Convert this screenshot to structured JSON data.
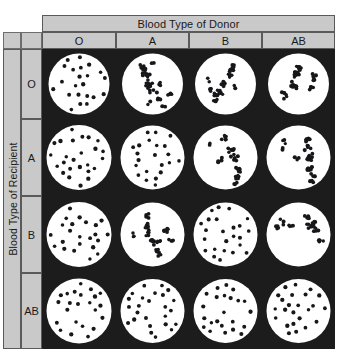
{
  "figure": {
    "column_axis_title": "Blood Type of Donor",
    "row_axis_title": "Blood Type of Recipient",
    "donor_types": [
      "O",
      "A",
      "B",
      "AB"
    ],
    "recipient_types": [
      "O",
      "A",
      "B",
      "AB"
    ],
    "colors": {
      "header_fill": "#c9c9c9",
      "header_border": "#5a5a5a",
      "well_background": "#1c1c1c",
      "plate_fill": "#ffffff",
      "cell_fill": "#17171a"
    }
  },
  "chart_data": {
    "type": "heatmap",
    "title": "Blood Type of Donor",
    "xlabel": "Blood Type of Donor",
    "ylabel": "Blood Type of Recipient",
    "categories": [
      "O",
      "A",
      "B",
      "AB"
    ],
    "rows": [
      "O",
      "A",
      "B",
      "AB"
    ],
    "legend": [
      "dispersed = no agglutination (compatible)",
      "clumped = agglutination (incompatible)"
    ],
    "grid": false,
    "values": [
      [
        0,
        1,
        1,
        1
      ],
      [
        0,
        0,
        1,
        1
      ],
      [
        0,
        1,
        0,
        1
      ],
      [
        0,
        0,
        0,
        0
      ]
    ],
    "series": [
      {
        "name": "O recipient",
        "donors": [
          "O",
          "A",
          "B",
          "AB"
        ],
        "reaction": [
          "dispersed",
          "clumped",
          "clumped",
          "clumped"
        ]
      },
      {
        "name": "A recipient",
        "donors": [
          "O",
          "A",
          "B",
          "AB"
        ],
        "reaction": [
          "dispersed",
          "dispersed",
          "clumped",
          "clumped"
        ]
      },
      {
        "name": "B recipient",
        "donors": [
          "O",
          "A",
          "B",
          "AB"
        ],
        "reaction": [
          "dispersed",
          "clumped",
          "dispersed",
          "clumped"
        ]
      },
      {
        "name": "AB recipient",
        "donors": [
          "O",
          "A",
          "B",
          "AB"
        ],
        "reaction": [
          "dispersed",
          "dispersed",
          "dispersed",
          "dispersed"
        ]
      }
    ]
  }
}
